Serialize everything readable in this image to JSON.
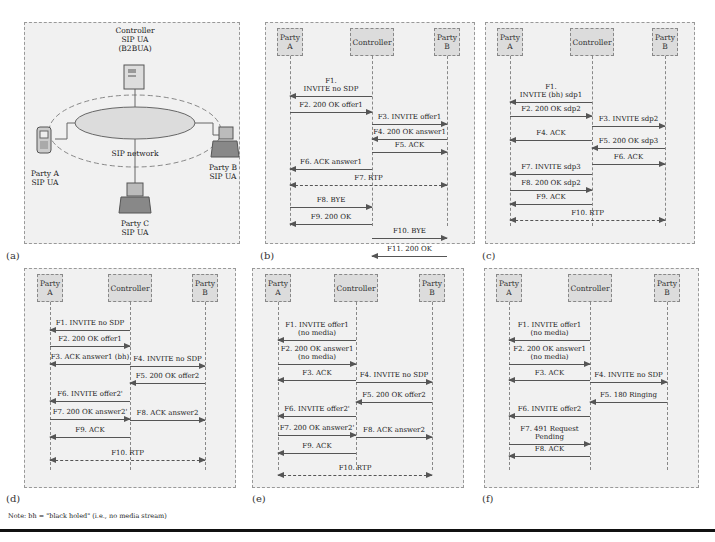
{
  "panel_a": {
    "label": "(a)",
    "controller": [
      "Controller",
      "SIP UA",
      "(B2BUA)"
    ],
    "network": "SIP network",
    "party_a": [
      "Party A",
      "SIP UA"
    ],
    "party_b": [
      "Party B",
      "SIP UA"
    ],
    "party_c": [
      "Party C",
      "SIP UA"
    ]
  },
  "actors": {
    "a": "Party A",
    "c": "Controller",
    "b": "Party B"
  },
  "panel_b": {
    "label": "(b)",
    "messages": [
      {
        "text": "F1.\nINVITE no SDP",
        "dir": "c2a"
      },
      {
        "text": "F2. 200 OK offer1",
        "dir": "a2c"
      },
      {
        "text": "F3. INVITE offer1",
        "dir": "c2b"
      },
      {
        "text": "F4. 200 OK answer1",
        "dir": "b2c"
      },
      {
        "text": "F5. ACK",
        "dir": "c2b"
      },
      {
        "text": "F6. ACK answer1",
        "dir": "c2a"
      },
      {
        "text": "F7. RTP",
        "dir": "a2b-media"
      },
      {
        "text": "F8. BYE",
        "dir": "a2c"
      },
      {
        "text": "F9. 200 OK",
        "dir": "c2a"
      },
      {
        "text": "F10. BYE",
        "dir": "c2b"
      },
      {
        "text": "F11. 200 OK",
        "dir": "b2c"
      }
    ]
  },
  "panel_c": {
    "label": "(c)",
    "messages": [
      {
        "text": "F1.\nINVITE (bh) sdp1",
        "dir": "c2a"
      },
      {
        "text": "F2. 200 OK sdp2",
        "dir": "a2c"
      },
      {
        "text": "F3. INVITE sdp2",
        "dir": "c2b"
      },
      {
        "text": "F4. ACK",
        "dir": "c2a"
      },
      {
        "text": "F5. 200 OK sdp3",
        "dir": "b2c"
      },
      {
        "text": "F6. ACK",
        "dir": "c2b"
      },
      {
        "text": "F7. INVITE sdp3",
        "dir": "c2a"
      },
      {
        "text": "F8. 200 OK sdp2",
        "dir": "a2c"
      },
      {
        "text": "F9. ACK",
        "dir": "c2a"
      },
      {
        "text": "F10. RTP",
        "dir": "a2b-media"
      }
    ]
  },
  "panel_d": {
    "label": "(d)",
    "messages": [
      {
        "text": "F1. INVITE no SDP",
        "dir": "c2a"
      },
      {
        "text": "F2. 200 OK offer1",
        "dir": "a2c"
      },
      {
        "text": "F3. ACK answer1 (bh)",
        "dir": "c2a"
      },
      {
        "text": "F4. INVITE no SDP",
        "dir": "c2b"
      },
      {
        "text": "F5. 200 OK offer2",
        "dir": "b2c"
      },
      {
        "text": "F6. INVITE offer2'",
        "dir": "c2a"
      },
      {
        "text": "F7. 200 OK answer2'",
        "dir": "a2c"
      },
      {
        "text": "F8. ACK answer2",
        "dir": "c2b"
      },
      {
        "text": "F9. ACK",
        "dir": "c2a"
      },
      {
        "text": "F10. RTP",
        "dir": "a2b-media"
      }
    ]
  },
  "panel_e": {
    "label": "(e)",
    "messages": [
      {
        "text": "F1. INVITE offer1\n(no media)",
        "dir": "c2a"
      },
      {
        "text": "F2. 200 OK answer1\n(no media)",
        "dir": "a2c"
      },
      {
        "text": "F3. ACK",
        "dir": "c2a"
      },
      {
        "text": "F4. INVITE no SDP",
        "dir": "c2b"
      },
      {
        "text": "F5. 200 OK offer2",
        "dir": "b2c"
      },
      {
        "text": "F6. INVITE offer2'",
        "dir": "c2a"
      },
      {
        "text": "F7. 200 OK answer2'",
        "dir": "a2c"
      },
      {
        "text": "F8. ACK answer2",
        "dir": "c2b"
      },
      {
        "text": "F9. ACK",
        "dir": "c2a"
      },
      {
        "text": "F10. RTP",
        "dir": "a2b-media"
      }
    ]
  },
  "panel_f": {
    "label": "(f)",
    "messages": [
      {
        "text": "F1. INVITE offer1\n(no media)",
        "dir": "c2a"
      },
      {
        "text": "F2. 200 OK answer1\n(no media)",
        "dir": "a2c"
      },
      {
        "text": "F3. ACK",
        "dir": "c2a"
      },
      {
        "text": "F4. INVITE no SDP",
        "dir": "c2b"
      },
      {
        "text": "F5. 180 Ringing",
        "dir": "b2c"
      },
      {
        "text": "F6. INVITE offer2",
        "dir": "c2a"
      },
      {
        "text": "F7. 491 Request\nPending",
        "dir": "a2c"
      },
      {
        "text": "F8. ACK",
        "dir": "c2a"
      }
    ]
  },
  "note": "Note: bh = \"black holed\" (i.e., no media stream)"
}
